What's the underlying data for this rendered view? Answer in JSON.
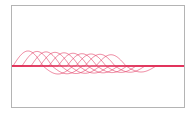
{
  "chart_data": {
    "type": "line",
    "title": "",
    "xlabel": "",
    "ylabel": "",
    "grid": false,
    "legend": null,
    "line_color": "#e0305a",
    "frame_color": "#b4b4b4",
    "plot_area": {
      "x0": 12,
      "x1": 184,
      "y_baseline": 66
    },
    "wave": {
      "period_px": 60,
      "pos_amplitude_px": 15,
      "neg_amplitude_px": 8
    },
    "series": [
      {
        "name": "wave-1",
        "start_x": 13,
        "amp_scale": 1.0
      },
      {
        "name": "wave-2",
        "start_x": 22,
        "amp_scale": 0.97
      },
      {
        "name": "wave-3",
        "start_x": 31,
        "amp_scale": 0.94
      },
      {
        "name": "wave-4",
        "start_x": 40,
        "amp_scale": 0.91
      },
      {
        "name": "wave-5",
        "start_x": 49,
        "amp_scale": 0.88
      },
      {
        "name": "wave-6",
        "start_x": 58,
        "amp_scale": 0.85
      },
      {
        "name": "wave-7",
        "start_x": 67,
        "amp_scale": 0.82
      },
      {
        "name": "wave-8",
        "start_x": 76,
        "amp_scale": 0.8
      },
      {
        "name": "wave-9",
        "start_x": 85,
        "amp_scale": 0.78
      },
      {
        "name": "wave-10",
        "start_x": 96,
        "amp_scale": 0.75
      }
    ]
  }
}
